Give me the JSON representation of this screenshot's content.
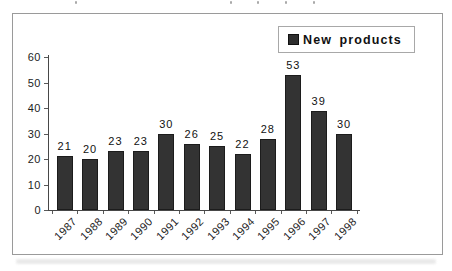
{
  "figure": {
    "legend": {
      "label": "New products"
    },
    "colors": {
      "bar": "#333333",
      "axis": "#474747",
      "frame_border": "#9a9a9a",
      "legend_border": "#a8a8a8",
      "text": "#1d1d1d",
      "background": "#ffffff"
    }
  },
  "chart_data": {
    "type": "bar",
    "categories": [
      "1987",
      "1988",
      "1989",
      "1990",
      "1991",
      "1992",
      "1993",
      "1994",
      "1995",
      "1996",
      "1997",
      "1998"
    ],
    "series": [
      {
        "name": "New products",
        "values": [
          21,
          20,
          23,
          23,
          30,
          26,
          25,
          22,
          28,
          53,
          39,
          30
        ]
      }
    ],
    "title": "",
    "xlabel": "",
    "ylabel": "",
    "ylim": [
      0,
      60
    ],
    "yticks": [
      0,
      10,
      20,
      30,
      40,
      50,
      60
    ],
    "grid": false,
    "legend_position": "top-right",
    "bar_labels": true,
    "x_tick_rotation": -45
  }
}
